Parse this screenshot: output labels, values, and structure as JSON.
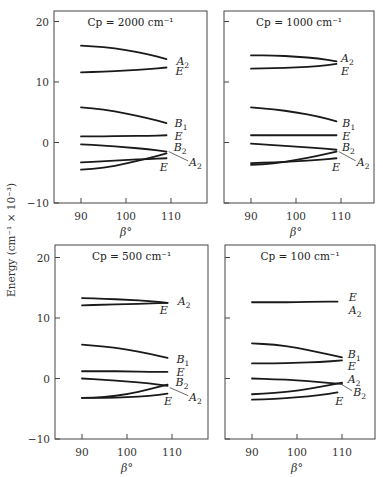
{
  "figure": {
    "ylabel": "Energy (cm⁻¹ × 10⁻³)",
    "xlabel": "β°"
  },
  "chart_data": [
    {
      "type": "line",
      "title": "Cp = 2000 cm⁻¹",
      "xlabel": "β°",
      "ylabel": "Energy (cm⁻¹ × 10⁻³)",
      "xlim": [
        84,
        117
      ],
      "ylim": [
        -10,
        22
      ],
      "xticks": [
        90,
        100,
        110
      ],
      "yticks": [
        -10,
        0,
        10,
        20
      ],
      "series": [
        {
          "name": "A2",
          "x": [
            90,
            95,
            100,
            105,
            109
          ],
          "values": [
            16.0,
            15.8,
            15.3,
            14.6,
            13.8
          ]
        },
        {
          "name": "E",
          "x": [
            90,
            95,
            100,
            105,
            109
          ],
          "values": [
            11.6,
            11.7,
            11.9,
            12.1,
            12.4
          ]
        },
        {
          "name": "B1",
          "x": [
            90,
            95,
            100,
            105,
            109
          ],
          "values": [
            5.8,
            5.5,
            4.8,
            4.0,
            3.2
          ]
        },
        {
          "name": "E",
          "x": [
            90,
            95,
            100,
            105,
            109
          ],
          "values": [
            1.0,
            1.0,
            1.1,
            1.1,
            1.2
          ]
        },
        {
          "name": "B2",
          "x": [
            90,
            95,
            100,
            105,
            109
          ],
          "values": [
            -0.3,
            -0.5,
            -0.8,
            -1.1,
            -1.5
          ]
        },
        {
          "name": "A2",
          "x": [
            90,
            95,
            100,
            105,
            109
          ],
          "values": [
            -4.5,
            -4.2,
            -3.5,
            -2.6,
            -1.8
          ]
        },
        {
          "name": "E",
          "x": [
            90,
            95,
            100,
            105,
            109
          ],
          "values": [
            -3.3,
            -3.1,
            -2.9,
            -2.7,
            -2.6
          ]
        }
      ],
      "annotations": [
        "A2",
        "E",
        "B1",
        "E",
        "B2",
        "A2",
        "E"
      ]
    },
    {
      "type": "line",
      "title": "Cp = 1000 cm⁻¹",
      "xlabel": "β°",
      "ylabel": "Energy (cm⁻¹ × 10⁻³)",
      "xlim": [
        84,
        117
      ],
      "ylim": [
        -10,
        22
      ],
      "xticks": [
        90,
        100,
        110
      ],
      "yticks": [
        -10,
        0,
        10,
        20
      ],
      "series": [
        {
          "name": "A2",
          "x": [
            90,
            95,
            100,
            105,
            109
          ],
          "values": [
            14.4,
            14.4,
            14.2,
            13.9,
            13.4
          ]
        },
        {
          "name": "E",
          "x": [
            90,
            95,
            100,
            105,
            109
          ],
          "values": [
            12.2,
            12.3,
            12.4,
            12.6,
            13.0
          ]
        },
        {
          "name": "B1",
          "x": [
            90,
            95,
            100,
            105,
            109
          ],
          "values": [
            5.8,
            5.5,
            5.0,
            4.3,
            3.5
          ]
        },
        {
          "name": "E",
          "x": [
            90,
            95,
            100,
            105,
            109
          ],
          "values": [
            1.2,
            1.2,
            1.2,
            1.2,
            1.2
          ]
        },
        {
          "name": "B2",
          "x": [
            90,
            95,
            100,
            105,
            109
          ],
          "values": [
            -0.2,
            -0.4,
            -0.7,
            -0.9,
            -1.2
          ]
        },
        {
          "name": "A2",
          "x": [
            90,
            95,
            100,
            105,
            109
          ],
          "values": [
            -3.7,
            -3.5,
            -2.9,
            -2.2,
            -1.5
          ]
        },
        {
          "name": "E",
          "x": [
            90,
            95,
            100,
            105,
            109
          ],
          "values": [
            -3.4,
            -3.3,
            -3.1,
            -2.9,
            -2.6
          ]
        }
      ],
      "annotations": [
        "A2",
        "E",
        "B1",
        "E",
        "B2",
        "A2",
        "E"
      ]
    },
    {
      "type": "line",
      "title": "Cp = 500 cm⁻¹",
      "xlabel": "β°",
      "ylabel": "Energy (cm⁻¹ × 10⁻³)",
      "xlim": [
        84,
        117
      ],
      "ylim": [
        -10,
        22
      ],
      "xticks": [
        90,
        100,
        110
      ],
      "yticks": [
        -10,
        0,
        10,
        20
      ],
      "series": [
        {
          "name": "A2",
          "x": [
            90,
            95,
            100,
            105,
            109
          ],
          "values": [
            13.3,
            13.2,
            13.0,
            12.8,
            12.5
          ]
        },
        {
          "name": "E",
          "x": [
            90,
            95,
            100,
            105,
            109
          ],
          "values": [
            12.1,
            12.2,
            12.3,
            12.4,
            12.5
          ]
        },
        {
          "name": "B1",
          "x": [
            90,
            95,
            100,
            105,
            109
          ],
          "values": [
            5.6,
            5.3,
            4.8,
            4.1,
            3.4
          ]
        },
        {
          "name": "E",
          "x": [
            90,
            95,
            100,
            105,
            109
          ],
          "values": [
            1.2,
            1.2,
            1.2,
            1.1,
            1.1
          ]
        },
        {
          "name": "B2",
          "x": [
            90,
            95,
            100,
            105,
            109
          ],
          "values": [
            0.0,
            -0.2,
            -0.5,
            -0.8,
            -1.2
          ]
        },
        {
          "name": "A2",
          "x": [
            90,
            95,
            100,
            105,
            109
          ],
          "values": [
            -3.2,
            -3.1,
            -2.6,
            -1.8,
            -1.0
          ]
        },
        {
          "name": "E",
          "x": [
            90,
            95,
            100,
            105,
            109
          ],
          "values": [
            -3.2,
            -3.2,
            -3.1,
            -2.9,
            -2.5
          ]
        }
      ],
      "annotations": [
        "A2",
        "E",
        "B1",
        "E",
        "B2",
        "A2",
        "E"
      ]
    },
    {
      "type": "line",
      "title": "Cp = 100 cm⁻¹",
      "xlabel": "β°",
      "ylabel": "Energy (cm⁻¹ × 10⁻³)",
      "xlim": [
        84,
        117
      ],
      "ylim": [
        -10,
        22
      ],
      "xticks": [
        90,
        100,
        110
      ],
      "yticks": [
        -10,
        0,
        10,
        20
      ],
      "series": [
        {
          "name": "E/A2",
          "x": [
            90,
            95,
            100,
            105,
            109
          ],
          "values": [
            12.6,
            12.6,
            12.6,
            12.7,
            12.7
          ]
        },
        {
          "name": "B1",
          "x": [
            90,
            95,
            100,
            105,
            110
          ],
          "values": [
            5.8,
            5.6,
            5.1,
            4.3,
            3.5
          ]
        },
        {
          "name": "E",
          "x": [
            90,
            95,
            100,
            105,
            110
          ],
          "values": [
            2.5,
            2.5,
            2.6,
            2.7,
            3.0
          ]
        },
        {
          "name": "A2",
          "x": [
            90,
            95,
            100,
            105,
            110
          ],
          "values": [
            0.0,
            -0.1,
            -0.3,
            -0.6,
            -0.9
          ]
        },
        {
          "name": "B2",
          "x": [
            90,
            95,
            100,
            105,
            110
          ],
          "values": [
            -2.6,
            -2.4,
            -2.0,
            -1.4,
            -0.7
          ]
        },
        {
          "name": "E",
          "x": [
            90,
            95,
            100,
            105,
            109
          ],
          "values": [
            -3.5,
            -3.4,
            -3.1,
            -2.8,
            -2.3
          ]
        }
      ],
      "annotations": [
        "E",
        "A2",
        "B1",
        "E",
        "A2",
        "B2",
        "E"
      ]
    }
  ],
  "panels": [
    {
      "title": "Cp = 2000 cm⁻¹",
      "yticks": [
        "20",
        "10",
        "0",
        "−10"
      ],
      "xticks": [
        "90",
        "100",
        "110"
      ],
      "labels": [
        {
          "sym": "A",
          "sub": "2",
          "x": 111.2,
          "y": 13.5
        },
        {
          "sym": "E",
          "sub": "",
          "x": 111.0,
          "y": 11.9
        },
        {
          "sym": "B",
          "sub": "1",
          "x": 110.8,
          "y": 3.3
        },
        {
          "sym": "E",
          "sub": "",
          "x": 110.8,
          "y": 1.0
        },
        {
          "sym": "B",
          "sub": "2",
          "x": 110.6,
          "y": -0.8
        },
        {
          "sym": "A",
          "sub": "2",
          "x": 114.0,
          "y": -3.2
        },
        {
          "sym": "E",
          "sub": "",
          "x": 107.5,
          "y": -4.0
        }
      ]
    },
    {
      "title": "Cp = 1000 cm⁻¹",
      "yticks": [
        "",
        "",
        "",
        ""
      ],
      "xticks": [
        "90",
        "100",
        "110"
      ],
      "labels": [
        {
          "sym": "A",
          "sub": "2",
          "x": 110.0,
          "y": 14.0
        },
        {
          "sym": "E",
          "sub": "",
          "x": 110.0,
          "y": 11.9
        },
        {
          "sym": "B",
          "sub": "1",
          "x": 110.3,
          "y": 3.3
        },
        {
          "sym": "E",
          "sub": "",
          "x": 110.3,
          "y": 1.0
        },
        {
          "sym": "B",
          "sub": "2",
          "x": 110.2,
          "y": -0.8
        },
        {
          "sym": "A",
          "sub": "2",
          "x": 113.5,
          "y": -3.2
        },
        {
          "sym": "E",
          "sub": "",
          "x": 108.0,
          "y": -4.0
        }
      ]
    },
    {
      "title": "Cp = 500 cm⁻¹",
      "yticks": [
        "20",
        "10",
        "0",
        "−10"
      ],
      "xticks": [
        "90",
        "100",
        "110"
      ],
      "labels": [
        {
          "sym": "A",
          "sub": "2",
          "x": 111.3,
          "y": 12.8
        },
        {
          "sym": "E",
          "sub": "",
          "x": 107.3,
          "y": 11.3
        },
        {
          "sym": "B",
          "sub": "1",
          "x": 111.0,
          "y": 3.2
        },
        {
          "sym": "E",
          "sub": "",
          "x": 111.0,
          "y": 1.0
        },
        {
          "sym": "B",
          "sub": "2",
          "x": 110.8,
          "y": -0.6
        },
        {
          "sym": "A",
          "sub": "2",
          "x": 113.8,
          "y": -3.0
        },
        {
          "sym": "E",
          "sub": "",
          "x": 108.2,
          "y": -3.8
        }
      ]
    },
    {
      "title": "Cp = 100 cm⁻¹",
      "yticks": [
        "",
        "",
        "",
        ""
      ],
      "xticks": [
        "90",
        "100",
        "110"
      ],
      "labels": [
        {
          "sym": "E",
          "sub": "",
          "x": 111.5,
          "y": 13.5
        },
        {
          "sym": "A",
          "sub": "2",
          "x": 111.5,
          "y": 11.3
        },
        {
          "sym": "B",
          "sub": "1",
          "x": 111.3,
          "y": 4.0
        },
        {
          "sym": "E",
          "sub": "",
          "x": 111.3,
          "y": 2.0
        },
        {
          "sym": "A",
          "sub": "2",
          "x": 111.3,
          "y": 0.0
        },
        {
          "sym": "B",
          "sub": "2",
          "x": 112.5,
          "y": -2.2
        },
        {
          "sym": "E",
          "sub": "",
          "x": 108.5,
          "y": -3.7
        }
      ]
    }
  ]
}
